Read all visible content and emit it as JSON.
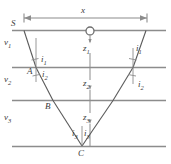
{
  "figure": {
    "type": "seismic-refraction-raypath-diagram",
    "colors": {
      "layer_line": "#8c8c8c",
      "ray": "#5a5a5a",
      "label": "#3b3b3b",
      "dimension_line": "#8c8c8c",
      "background": "#ffffff"
    },
    "labels": {
      "source": "S",
      "offset_dimension": "x",
      "velocity_layer_1": "v",
      "velocity_layer_1_sub": "1",
      "velocity_layer_2": "v",
      "velocity_layer_2_sub": "2",
      "velocity_layer_3": "v",
      "velocity_layer_3_sub": "3",
      "depth_1": "z",
      "depth_1_sub": "1",
      "depth_2": "z",
      "depth_2_sub": "2",
      "depth_3": "z",
      "depth_3_sub": "3",
      "angle_i1_left": "i",
      "angle_i1_left_sub": "1",
      "angle_i2_left": "i",
      "angle_i2_left_sub": "2",
      "angle_i1_right": "i",
      "angle_i1_right_sub": "1",
      "angle_i2_right": "i",
      "angle_i2_right_sub": "2",
      "angle_i3_left": "i",
      "angle_i3_left_sub": "3",
      "angle_i3_right": "i",
      "angle_i3_right_sub": "3",
      "point_a": "A",
      "point_b": "B",
      "point_c": "C"
    }
  }
}
